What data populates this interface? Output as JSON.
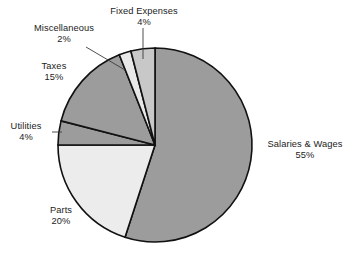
{
  "chart_data": {
    "type": "pie",
    "title": "",
    "subtitle": "",
    "xlabel": "",
    "ylabel": "",
    "legend_position": "none",
    "labels_position": "outside",
    "grid": false,
    "units": "percent",
    "total": 100,
    "start_angle_deg": 0,
    "direction": "clockwise",
    "categories": [
      "Salaries & Wages",
      "Parts",
      "Utilities",
      "Taxes",
      "Miscellaneous",
      "Fixed Expenses"
    ],
    "values": [
      55,
      20,
      4,
      15,
      2,
      4
    ],
    "slices": [
      {
        "name": "Salaries & Wages",
        "value": 55,
        "value_label": "55%",
        "color": "#9c9c9c",
        "label_name": "Salaries & Wages",
        "label_pct": "55%"
      },
      {
        "name": "Parts",
        "value": 20,
        "value_label": "20%",
        "color": "#ececec",
        "label_name": "Parts",
        "label_pct": "20%"
      },
      {
        "name": "Utilities",
        "value": 4,
        "value_label": "4%",
        "color": "#9c9c9c",
        "label_name": "Utilities",
        "label_pct": "4%"
      },
      {
        "name": "Taxes",
        "value": 15,
        "value_label": "15%",
        "color": "#9c9c9c",
        "label_name": "Taxes",
        "label_pct": "15%"
      },
      {
        "name": "Miscellaneous",
        "value": 2,
        "value_label": "2%",
        "color": "#e8e8e8",
        "label_name": "Miscellaneous",
        "label_pct": "2%"
      },
      {
        "name": "Fixed Expenses",
        "value": 4,
        "value_label": "4%",
        "color": "#c8c8c8",
        "label_name": "Fixed Expenses",
        "label_pct": "4%"
      }
    ],
    "colors": {
      "outline": "#111111",
      "background": "#ffffff",
      "text": "#1c1c1c",
      "leader_line": "#3a3a3a"
    }
  }
}
